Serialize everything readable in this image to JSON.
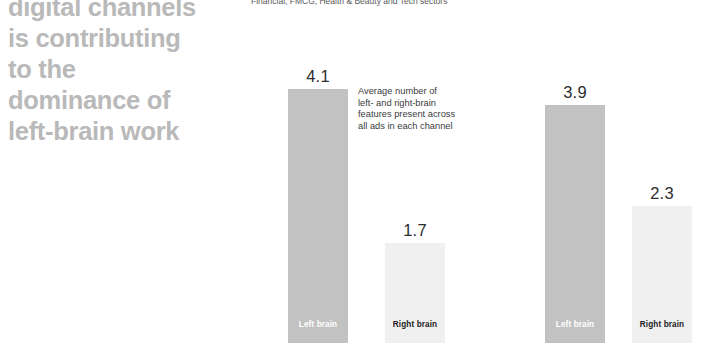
{
  "headline": {
    "lines": [
      "digital channels",
      "is contributing",
      "to the",
      "dominance of",
      "left-brain work"
    ],
    "color": "#b9b9b9"
  },
  "subtitle": {
    "text": "Financial, FMCG, Health & Beauty and Tech sectors"
  },
  "annotation": {
    "lines": [
      "Average number of",
      "left- and right-brain",
      "features present across",
      "all ads in each channel"
    ]
  },
  "colors": {
    "left_brain_bar": "#c2c2c2",
    "right_brain_bar": "#f0f0f0",
    "headline": "#b9b9b9",
    "value_label": "#2d2d2f",
    "background": "#ffffff"
  },
  "chart_data": {
    "type": "bar",
    "title": "",
    "subtitle": "Financial, FMCG, Health & Beauty and Tech sectors",
    "xlabel": "",
    "ylabel": "",
    "ylim": [
      0,
      4.1
    ],
    "grid": false,
    "legend": "none",
    "categories": [
      "Left brain",
      "Right brain"
    ],
    "groups": [
      {
        "name": "group-1",
        "bars": [
          {
            "label": "Left brain",
            "value": 4.1,
            "value_text": "4.1",
            "series": "left-brain"
          },
          {
            "label": "Right brain",
            "value": 1.7,
            "value_text": "1.7",
            "series": "right-brain"
          }
        ]
      },
      {
        "name": "group-2",
        "bars": [
          {
            "label": "Left brain",
            "value": 3.9,
            "value_text": "3.9",
            "series": "left-brain"
          },
          {
            "label": "Right brain",
            "value": 2.3,
            "value_text": "2.3",
            "series": "right-brain"
          }
        ]
      }
    ],
    "series": [
      {
        "name": "Left brain",
        "values": [
          4.1,
          3.9
        ]
      },
      {
        "name": "Right brain",
        "values": [
          1.7,
          2.3
        ]
      }
    ],
    "annotation": "Average number of left- and right-brain features present across all ads in each channel"
  },
  "layout": {
    "bars": [
      {
        "x": 288,
        "width": 60,
        "height": 254,
        "data": "chart_data.groups.0.bars.0"
      },
      {
        "x": 385,
        "width": 60,
        "height": 100,
        "data": "chart_data.groups.0.bars.1"
      },
      {
        "x": 545,
        "width": 60,
        "height": 238,
        "data": "chart_data.groups.1.bars.0"
      },
      {
        "x": 632,
        "width": 60,
        "height": 137,
        "data": "chart_data.groups.1.bars.1"
      }
    ]
  }
}
